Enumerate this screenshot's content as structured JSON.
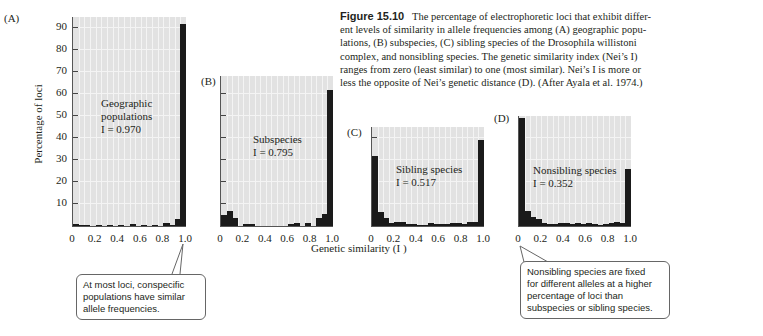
{
  "caption": {
    "figure_label": "Figure 15.10",
    "lines": [
      "The percentage of electrophoretic loci that exhibit differ-",
      "ent levels of similarity in allele frequencies among (A) geographic popu-",
      "lations, (B) subspecies, (C) sibling species of the Drosophila willistoni",
      "complex, and nonsibling species. The genetic similarity index (Nei’s I)",
      "ranges from zero (least similar) to one (most similar). Nei’s I is more or",
      "less the opposite of Nei’s genetic distance (D). (After Ayala et al. 1974.)"
    ]
  },
  "axes": {
    "ylabel": "Percentage of loci",
    "xlabel": "Genetic similarity (I )",
    "yticks": [
      "10",
      "20",
      "30",
      "40",
      "50",
      "60",
      "70",
      "80",
      "90"
    ],
    "xticks": [
      "0",
      "0.2",
      "0.4",
      "0.6",
      "0.8",
      "1.0"
    ]
  },
  "callouts": {
    "left": [
      "At most loci, conspecific",
      "populations have similar",
      "allele frequencies."
    ],
    "right": [
      "Nonsibling species are fixed",
      "for different alleles at a higher",
      "percentage of loci than",
      "subspecies or sibling species."
    ]
  },
  "chart_data": [
    {
      "type": "bar",
      "panel": "(A)",
      "title": "Geographic populations",
      "annotation": "I = 0.970",
      "xlabel": "Genetic similarity (I)",
      "ylabel": "Percentage of loci",
      "xlim": [
        0,
        1.0
      ],
      "ylim": [
        0,
        95
      ],
      "categories": [
        "0-0.05",
        "0.05-0.1",
        "0.1-0.15",
        "0.15-0.2",
        "0.2-0.25",
        "0.25-0.3",
        "0.3-0.35",
        "0.35-0.4",
        "0.4-0.45",
        "0.45-0.5",
        "0.5-0.55",
        "0.55-0.6",
        "0.6-0.65",
        "0.65-0.7",
        "0.7-0.75",
        "0.75-0.8",
        "0.8-0.85",
        "0.85-0.9",
        "0.9-0.95",
        "0.95-1.0"
      ],
      "values": [
        0.8,
        0.5,
        0.3,
        0,
        0.3,
        0,
        0.2,
        0,
        0.5,
        0,
        0.8,
        0,
        0.5,
        0,
        0.3,
        0,
        1.2,
        0.5,
        3,
        92
      ]
    },
    {
      "type": "bar",
      "panel": "(B)",
      "title": "Subspecies",
      "annotation": "I = 0.795",
      "xlim": [
        0,
        1.0
      ],
      "ylim": [
        0,
        95
      ],
      "categories": [
        "0-0.05",
        "0.05-0.1",
        "0.1-0.15",
        "0.15-0.2",
        "0.2-0.25",
        "0.25-0.3",
        "0.3-0.35",
        "0.35-0.4",
        "0.4-0.45",
        "0.45-0.5",
        "0.5-0.55",
        "0.55-0.6",
        "0.6-0.65",
        "0.65-0.7",
        "0.7-0.75",
        "0.75-0.8",
        "0.8-0.85",
        "0.85-0.9",
        "0.9-0.95",
        "0.95-1.0"
      ],
      "values": [
        5,
        7,
        3.5,
        0,
        1,
        1,
        0,
        0,
        0,
        0,
        0,
        0,
        1,
        1.5,
        0,
        1.5,
        0,
        3.5,
        5.5,
        62
      ]
    },
    {
      "type": "bar",
      "panel": "(C)",
      "title": "Sibling species",
      "annotation": "I = 0.517",
      "xlim": [
        0,
        1.0
      ],
      "ylim": [
        0,
        95
      ],
      "categories": [
        "0-0.05",
        "0.05-0.1",
        "0.1-0.15",
        "0.15-0.2",
        "0.2-0.25",
        "0.25-0.3",
        "0.3-0.35",
        "0.35-0.4",
        "0.4-0.45",
        "0.45-0.5",
        "0.5-0.55",
        "0.55-0.6",
        "0.6-0.65",
        "0.65-0.7",
        "0.7-0.75",
        "0.75-0.8",
        "0.8-0.85",
        "0.85-0.9",
        "0.9-0.95",
        "0.95-1.0"
      ],
      "values": [
        32,
        6.5,
        3.5,
        1.5,
        2,
        2,
        1,
        1,
        0.5,
        0.5,
        1.5,
        1,
        1,
        1,
        1.5,
        1.5,
        1,
        2,
        2,
        39
      ]
    },
    {
      "type": "bar",
      "panel": "(D)",
      "title": "Nonsibling species",
      "annotation": "I = 0.352",
      "xlim": [
        0,
        1.0
      ],
      "ylim": [
        0,
        95
      ],
      "categories": [
        "0-0.05",
        "0.05-0.1",
        "0.1-0.15",
        "0.15-0.2",
        "0.2-0.25",
        "0.25-0.3",
        "0.3-0.35",
        "0.35-0.4",
        "0.4-0.45",
        "0.45-0.5",
        "0.5-0.55",
        "0.55-0.6",
        "0.6-0.65",
        "0.65-0.7",
        "0.7-0.75",
        "0.75-0.8",
        "0.8-0.85",
        "0.85-0.9",
        "0.9-0.95",
        "0.95-1.0"
      ],
      "values": [
        49,
        7,
        4,
        3,
        1.5,
        1,
        1,
        1.5,
        1.5,
        1,
        1.5,
        1,
        1.5,
        1,
        0.5,
        1,
        1.5,
        2,
        1.5,
        26
      ]
    }
  ]
}
